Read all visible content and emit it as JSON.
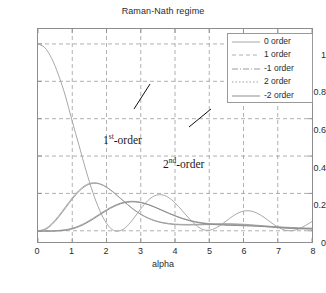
{
  "chart_data": {
    "type": "line",
    "title": "Raman-Nath regime",
    "xlabel": "alpha",
    "ylabel": "",
    "xlim": [
      0,
      8
    ],
    "ylim": [
      -0.06,
      1.08
    ],
    "grid": true,
    "xticks": [
      0,
      1,
      2,
      3,
      4,
      5,
      6,
      7,
      8
    ],
    "xtick_labels": [
      "0",
      "1",
      "2",
      "3",
      "4",
      "5",
      "6",
      "7",
      "8"
    ],
    "yticks": [
      0,
      0.2,
      0.4,
      0.6,
      0.8,
      1
    ],
    "ytick_labels": [
      "0",
      "0.2",
      "0.4",
      "0.6",
      "0.8",
      "1"
    ],
    "legend_position": "top-right",
    "x": [
      0,
      0.2,
      0.4,
      0.6,
      0.8,
      1.0,
      1.2,
      1.4,
      1.6,
      1.8,
      2.0,
      2.2,
      2.4,
      2.6,
      2.8,
      3.0,
      3.2,
      3.4,
      3.6,
      3.8,
      4.0,
      4.2,
      4.4,
      4.6,
      4.8,
      5.0,
      5.2,
      5.4,
      5.6,
      5.8,
      6.0,
      6.2,
      6.4,
      6.6,
      6.8,
      7.0,
      7.2,
      7.4,
      7.6,
      7.8,
      8.0
    ],
    "series": [
      {
        "name": "0 order",
        "values": [
          1.0,
          0.9801,
          0.9224,
          0.8331,
          0.7211,
          0.5855,
          0.4552,
          0.3237,
          0.2057,
          0.1096,
          0.0401,
          0.0024,
          0.0004,
          0.0246,
          0.068,
          0.1174,
          0.1604,
          0.1869,
          0.193,
          0.1792,
          0.1495,
          0.11,
          0.0685,
          0.0325,
          0.0078,
          0.0031,
          0.0155,
          0.0393,
          0.0671,
          0.0912,
          0.1053,
          0.1063,
          0.0941,
          0.0718,
          0.0448,
          0.02,
          0.0039,
          0.0002,
          0.0091,
          0.0274,
          0.0497
        ]
      },
      {
        "name": "1 order",
        "values": [
          0.0,
          0.0099,
          0.038,
          0.0795,
          0.1281,
          0.1764,
          0.2173,
          0.2453,
          0.257,
          0.2524,
          0.2342,
          0.2067,
          0.1749,
          0.1429,
          0.1137,
          0.0892,
          0.07,
          0.0558,
          0.0459,
          0.0396,
          0.036,
          0.0343,
          0.034,
          0.0346,
          0.0356,
          0.0368,
          0.0377,
          0.0382,
          0.038,
          0.037,
          0.0352,
          0.0327,
          0.0297,
          0.0264,
          0.0231,
          0.02,
          0.0172,
          0.0149,
          0.0133,
          0.0123,
          0.012
        ]
      },
      {
        "name": "-1 order",
        "values": [
          0.0,
          0.0099,
          0.038,
          0.0795,
          0.1281,
          0.1764,
          0.2173,
          0.2453,
          0.257,
          0.2524,
          0.2342,
          0.2067,
          0.1749,
          0.1429,
          0.1137,
          0.0892,
          0.07,
          0.0558,
          0.0459,
          0.0396,
          0.036,
          0.0343,
          0.034,
          0.0346,
          0.0356,
          0.0368,
          0.0377,
          0.0382,
          0.038,
          0.037,
          0.0352,
          0.0327,
          0.0297,
          0.0264,
          0.0231,
          0.02,
          0.0172,
          0.0149,
          0.0133,
          0.0123,
          0.012
        ]
      },
      {
        "name": "2 order",
        "values": [
          0.0,
          0.0001,
          0.0004,
          0.0019,
          0.0058,
          0.0137,
          0.0265,
          0.0443,
          0.066,
          0.0896,
          0.1126,
          0.1326,
          0.1475,
          0.156,
          0.1576,
          0.1527,
          0.1424,
          0.1284,
          0.1124,
          0.0962,
          0.0811,
          0.0679,
          0.0571,
          0.0487,
          0.0425,
          0.0382,
          0.0353,
          0.0334,
          0.032,
          0.0309,
          0.0297,
          0.0284,
          0.0269,
          0.0251,
          0.0232,
          0.0212,
          0.0193,
          0.0175,
          0.016,
          0.0148,
          0.014
        ]
      },
      {
        "name": "-2 order",
        "values": [
          0.0,
          0.0001,
          0.0004,
          0.0019,
          0.0058,
          0.0137,
          0.0265,
          0.0443,
          0.066,
          0.0896,
          0.1126,
          0.1326,
          0.1475,
          0.156,
          0.1576,
          0.1527,
          0.1424,
          0.1284,
          0.1124,
          0.0962,
          0.0811,
          0.0679,
          0.0571,
          0.0487,
          0.0425,
          0.0382,
          0.0353,
          0.0334,
          0.032,
          0.0309,
          0.0297,
          0.0284,
          0.0269,
          0.0251,
          0.0232,
          0.0212,
          0.0193,
          0.0175,
          0.016,
          0.0148,
          0.014
        ]
      }
    ],
    "annotations": [
      {
        "text_main": "1",
        "sup": "st",
        "text_tail": "-order",
        "x": 2.05,
        "y": 0.47
      },
      {
        "text_main": "2",
        "sup": "nd",
        "text_tail": "-order",
        "x": 3.85,
        "y": 0.345
      }
    ],
    "colors": {
      "axis": "#8d8d8d",
      "grid": "#9d9d9d",
      "order0": "#a8a8a8",
      "order1": "#b0b0b0",
      "orderm1": "#9c9c9c",
      "order2": "#a0a0a0",
      "orderm2": "#8f8f8f",
      "text": "#2b2b2b",
      "annotation": "#1a1a1a"
    }
  },
  "legend": {
    "items": [
      {
        "label": "0 order",
        "style": "solid"
      },
      {
        "label": "1 order",
        "style": "dashed"
      },
      {
        "label": "-1 order",
        "style": "dashdot"
      },
      {
        "label": "2 order",
        "style": "dotted"
      },
      {
        "label": "-2 order",
        "style": "solid-thin"
      }
    ]
  }
}
